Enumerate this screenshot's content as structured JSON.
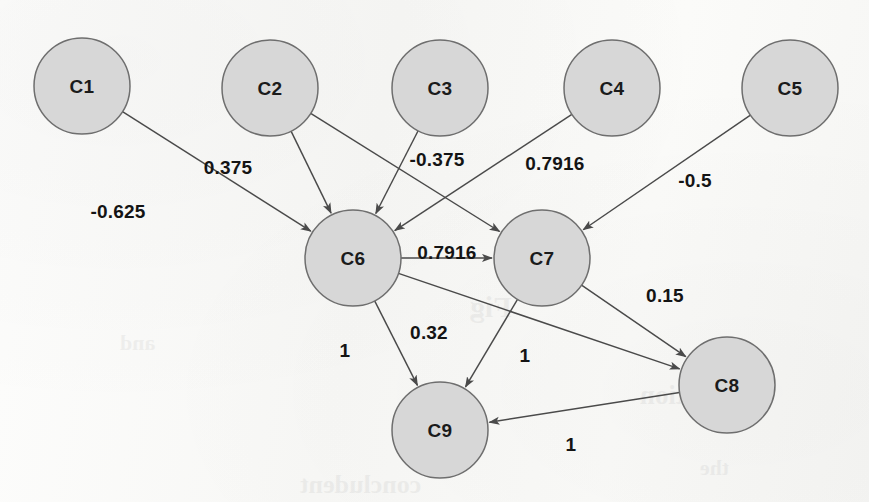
{
  "figure": {
    "type": "directed-weighted-graph",
    "background_color": "#fbfbfa",
    "node_fill_color": "#d7d7d7",
    "node_stroke_color": "#6e6e6e",
    "edge_color": "#4a4a4a",
    "label_color": "#141414"
  },
  "graph_data": {
    "type": "diagram",
    "directed": true,
    "weighted": true,
    "node_radius": 48,
    "nodes": [
      {
        "id": "C1",
        "label": "C1",
        "cx": 82,
        "cy": 86
      },
      {
        "id": "C2",
        "label": "C2",
        "cx": 270,
        "cy": 88
      },
      {
        "id": "C3",
        "label": "C3",
        "cx": 440,
        "cy": 88
      },
      {
        "id": "C4",
        "label": "C4",
        "cx": 612,
        "cy": 88
      },
      {
        "id": "C5",
        "label": "C5",
        "cx": 790,
        "cy": 88
      },
      {
        "id": "C6",
        "label": "C6",
        "cx": 353,
        "cy": 258
      },
      {
        "id": "C7",
        "label": "C7",
        "cx": 542,
        "cy": 258
      },
      {
        "id": "C8",
        "label": "C8",
        "cx": 727,
        "cy": 385
      },
      {
        "id": "C9",
        "label": "C9",
        "cx": 440,
        "cy": 430
      }
    ],
    "edges": [
      {
        "from": "C1",
        "to": "C6",
        "weight": "-0.625",
        "lx": 118,
        "ly": 211
      },
      {
        "from": "C2",
        "to": "C6",
        "weight": "0.375",
        "lx": 228,
        "ly": 167
      },
      {
        "from": "C2",
        "to": "C7",
        "weight": "",
        "lx": 0,
        "ly": 0
      },
      {
        "from": "C3",
        "to": "C6",
        "weight": "-0.375",
        "lx": 437,
        "ly": 159
      },
      {
        "from": "C4",
        "to": "C6",
        "weight": "0.7916",
        "lx": 555,
        "ly": 163
      },
      {
        "from": "C5",
        "to": "C7",
        "weight": "-0.5",
        "lx": 695,
        "ly": 180
      },
      {
        "from": "C6",
        "to": "C7",
        "weight": "0.7916",
        "lx": 447,
        "ly": 252
      },
      {
        "from": "C6",
        "to": "C8",
        "weight": "0.32",
        "lx": 429,
        "ly": 332
      },
      {
        "from": "C6",
        "to": "C9",
        "weight": "1",
        "lx": 345,
        "ly": 350
      },
      {
        "from": "C7",
        "to": "C9",
        "weight": "1",
        "lx": 525,
        "ly": 355
      },
      {
        "from": "C7",
        "to": "C8",
        "weight": "0.15",
        "lx": 665,
        "ly": 295
      },
      {
        "from": "C8",
        "to": "C9",
        "weight": "1",
        "lx": 571,
        "ly": 444
      }
    ]
  },
  "bleed_through": [
    {
      "text": "Fig",
      "x": 470,
      "y": 290,
      "size": 30
    },
    {
      "text": "ilustration",
      "x": 640,
      "y": 380,
      "size": 27
    },
    {
      "text": "concludent",
      "x": 300,
      "y": 470,
      "size": 26
    },
    {
      "text": "and",
      "x": 120,
      "y": 330,
      "size": 22
    },
    {
      "text": "the",
      "x": 700,
      "y": 455,
      "size": 22
    }
  ]
}
